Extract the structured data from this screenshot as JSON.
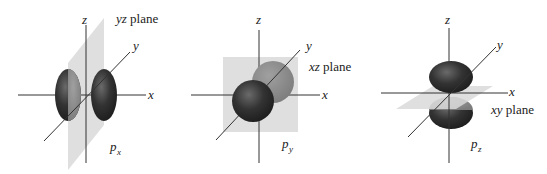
{
  "figures": [
    {
      "id": "px",
      "orbital_label": "p",
      "orbital_subscript": "x",
      "plane_label_italic": "yz",
      "plane_label_text": "plane",
      "axes": {
        "x": "x",
        "y": "y",
        "z": "z"
      }
    },
    {
      "id": "py",
      "orbital_label": "p",
      "orbital_subscript": "y",
      "plane_label_italic": "xz",
      "plane_label_text": "plane",
      "axes": {
        "x": "x",
        "y": "y",
        "z": "z"
      }
    },
    {
      "id": "pz",
      "orbital_label": "p",
      "orbital_subscript": "z",
      "plane_label_italic": "xy",
      "plane_label_text": "plane",
      "axes": {
        "x": "x",
        "y": "y",
        "z": "z"
      }
    }
  ],
  "colors": {
    "lobe_dark": "#2e2e2e",
    "lobe_light": "#8a8a8a",
    "plane": "#d6d6d6"
  }
}
